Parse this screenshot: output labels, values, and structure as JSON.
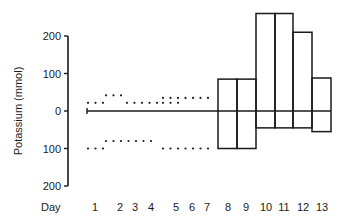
{
  "chart_data": {
    "type": "bar",
    "title": "",
    "xlabel": "Day",
    "ylabel": "Potassium (mmol)",
    "ylim": [
      -200,
      270
    ],
    "y_ticks": [
      200,
      100,
      0,
      -100,
      -200
    ],
    "y_tick_labels": [
      "200",
      "100",
      "0",
      "100",
      "200"
    ],
    "categories": [
      "1",
      "2",
      "3",
      "4",
      "5",
      "6",
      "7",
      "8",
      "9",
      "10",
      "11",
      "12",
      "13"
    ],
    "series": [
      {
        "name": "intake (dotted, days 1-7)",
        "style": "dotted",
        "segments": [
          {
            "day_start": 1,
            "day_end": 1,
            "value": 22
          },
          {
            "day_start": 2,
            "day_end": 2,
            "value": 42
          },
          {
            "day_start": 3,
            "day_end": 4,
            "value": 22
          },
          {
            "day_start": 5,
            "day_end": 5,
            "value": 22
          },
          {
            "day_start": 5,
            "day_end": 7,
            "value": 35
          }
        ]
      },
      {
        "name": "output (dotted, days 1-7)",
        "style": "dotted",
        "segments": [
          {
            "day_start": 1,
            "day_end": 1,
            "value": -100
          },
          {
            "day_start": 2,
            "day_end": 4,
            "value": -80
          },
          {
            "day_start": 5,
            "day_end": 7,
            "value": -100
          }
        ]
      },
      {
        "name": "boxes (days 8-13)",
        "style": "open-box",
        "boxes": [
          {
            "day": "8",
            "top": 85,
            "bottom": -100
          },
          {
            "day": "9",
            "top": 85,
            "bottom": -100
          },
          {
            "day": "10",
            "top": 260,
            "bottom": -45
          },
          {
            "day": "11",
            "top": 260,
            "bottom": -45
          },
          {
            "day": "12",
            "top": 210,
            "bottom": -45
          },
          {
            "day": "13",
            "top": 88,
            "bottom": -55
          }
        ]
      }
    ],
    "grid": false,
    "legend": null
  },
  "labels": {
    "ylabel": "Potassium (mmol)",
    "xlabel": "Day"
  }
}
